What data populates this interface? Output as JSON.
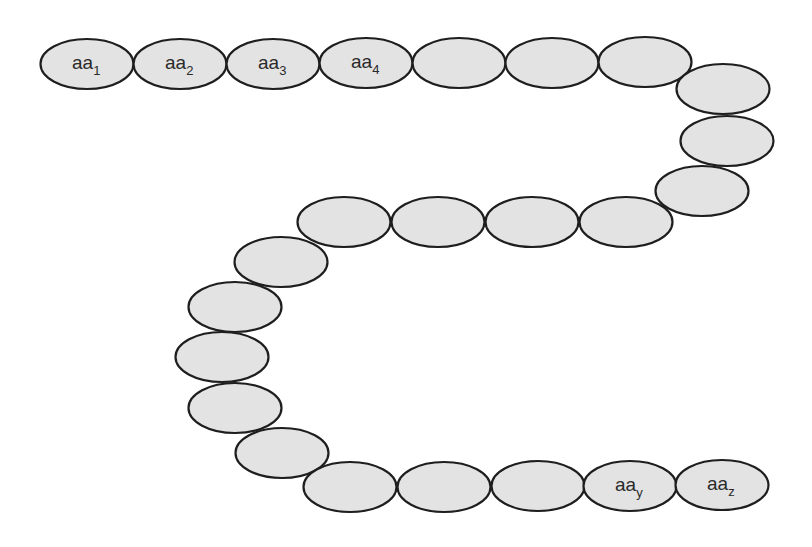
{
  "diagram": {
    "type": "polypeptide-chain",
    "colors": {
      "bead_fill": "#e3e3e3",
      "bead_stroke": "#1e1e1e",
      "background": "#ffffff",
      "text": "#2a2a2a"
    },
    "bead_size": {
      "rx": 46.5,
      "ry": 25
    },
    "beads": [
      {
        "cx": 87,
        "cy": 64,
        "base": "aa",
        "sub": "1"
      },
      {
        "cx": 180,
        "cy": 64,
        "base": "aa",
        "sub": "2"
      },
      {
        "cx": 273,
        "cy": 64,
        "base": "aa",
        "sub": "3"
      },
      {
        "cx": 366,
        "cy": 63,
        "base": "aa",
        "sub": "4"
      },
      {
        "cx": 459,
        "cy": 63,
        "base": "",
        "sub": ""
      },
      {
        "cx": 552,
        "cy": 63,
        "base": "",
        "sub": ""
      },
      {
        "cx": 645,
        "cy": 62,
        "base": "",
        "sub": ""
      },
      {
        "cx": 723,
        "cy": 89,
        "base": "",
        "sub": ""
      },
      {
        "cx": 727,
        "cy": 141,
        "base": "",
        "sub": ""
      },
      {
        "cx": 702,
        "cy": 191,
        "base": "",
        "sub": ""
      },
      {
        "cx": 626,
        "cy": 222,
        "base": "",
        "sub": ""
      },
      {
        "cx": 532,
        "cy": 222,
        "base": "",
        "sub": ""
      },
      {
        "cx": 438,
        "cy": 222,
        "base": "",
        "sub": ""
      },
      {
        "cx": 344,
        "cy": 222,
        "base": "",
        "sub": ""
      },
      {
        "cx": 281,
        "cy": 262,
        "base": "",
        "sub": ""
      },
      {
        "cx": 235,
        "cy": 307,
        "base": "",
        "sub": ""
      },
      {
        "cx": 222,
        "cy": 357,
        "base": "",
        "sub": ""
      },
      {
        "cx": 235,
        "cy": 408,
        "base": "",
        "sub": ""
      },
      {
        "cx": 282,
        "cy": 453,
        "base": "",
        "sub": ""
      },
      {
        "cx": 350,
        "cy": 487,
        "base": "",
        "sub": ""
      },
      {
        "cx": 444,
        "cy": 487,
        "base": "",
        "sub": ""
      },
      {
        "cx": 538,
        "cy": 486,
        "base": "",
        "sub": ""
      },
      {
        "cx": 630,
        "cy": 486,
        "base": "aa",
        "sub": "y"
      },
      {
        "cx": 722,
        "cy": 485,
        "base": "aa",
        "sub": "z"
      }
    ]
  }
}
